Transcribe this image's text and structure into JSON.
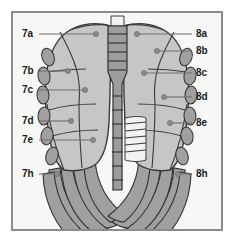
{
  "figure": {
    "frame_color": "#8b8b8b",
    "background_color": "#f7f7f5",
    "lung_fill": "#c6c6c6",
    "bone_fill": "#a0a0a0",
    "outline_color": "#3b3b3b",
    "leader_color": "#6f6f6f",
    "label_color": "#1a1a1a"
  },
  "labels": {
    "left": [
      {
        "text": "7a",
        "x": 22,
        "y": 37
      },
      {
        "text": "7b",
        "x": 22,
        "y": 74
      },
      {
        "text": "7c",
        "x": 22,
        "y": 93
      },
      {
        "text": "7d",
        "x": 22,
        "y": 124
      },
      {
        "text": "7e",
        "x": 22,
        "y": 143
      },
      {
        "text": "7h",
        "x": 22,
        "y": 177
      }
    ],
    "right": [
      {
        "text": "8a",
        "x": 196,
        "y": 37
      },
      {
        "text": "8b",
        "x": 196,
        "y": 54
      },
      {
        "text": "8c",
        "x": 196,
        "y": 76
      },
      {
        "text": "8d",
        "x": 196,
        "y": 100
      },
      {
        "text": "8e",
        "x": 196,
        "y": 126
      },
      {
        "text": "8h",
        "x": 196,
        "y": 177
      }
    ]
  },
  "leaders": {
    "left": [
      {
        "name": "leader-7a",
        "x1": 39,
        "y1": 34,
        "x2": 96,
        "y2": 34,
        "dx": 96,
        "dy": 34
      },
      {
        "name": "leader-7b",
        "x1": 39,
        "y1": 71,
        "x2": 68,
        "y2": 71,
        "dx": 68,
        "dy": 71
      },
      {
        "name": "leader-7c",
        "x1": 39,
        "y1": 90,
        "x2": 85,
        "y2": 90,
        "dx": 85,
        "dy": 90
      },
      {
        "name": "leader-7d",
        "x1": 39,
        "y1": 121,
        "x2": 71,
        "y2": 121,
        "dx": 71,
        "dy": 121
      },
      {
        "name": "leader-7e",
        "x1": 39,
        "y1": 140,
        "x2": 93,
        "y2": 140,
        "dx": 93,
        "dy": 140
      },
      {
        "name": "leader-7h",
        "x1": 39,
        "y1": 174,
        "x2": 57,
        "y2": 174,
        "dx": 57,
        "dy": 174
      }
    ],
    "right": [
      {
        "name": "leader-8a",
        "x1": 192,
        "y1": 34,
        "x2": 137,
        "y2": 34,
        "dx": 137,
        "dy": 34
      },
      {
        "name": "leader-8b",
        "x1": 192,
        "y1": 51,
        "x2": 157,
        "y2": 51,
        "dx": 157,
        "dy": 51
      },
      {
        "name": "leader-8c",
        "x1": 192,
        "y1": 73,
        "x2": 144,
        "y2": 73,
        "dx": 144,
        "dy": 73
      },
      {
        "name": "leader-8d",
        "x1": 192,
        "y1": 97,
        "x2": 164,
        "y2": 97,
        "dx": 164,
        "dy": 97
      },
      {
        "name": "leader-8e",
        "x1": 192,
        "y1": 123,
        "x2": 170,
        "y2": 123,
        "dx": 170,
        "dy": 123
      },
      {
        "name": "leader-8h",
        "x1": 192,
        "y1": 174,
        "x2": 178,
        "y2": 174,
        "dx": 178,
        "dy": 174
      }
    ]
  }
}
